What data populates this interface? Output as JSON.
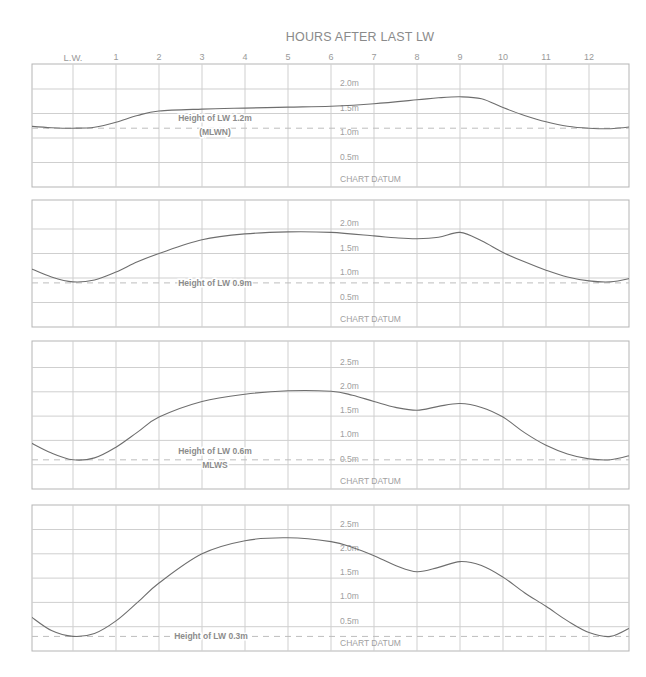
{
  "chart_data": {
    "type": "line",
    "title": "HOURS AFTER LAST LW",
    "xlabel": "HOURS AFTER LAST LW",
    "ylabel": "",
    "grid": true,
    "x_tick_labels": [
      "L.W.",
      "1",
      "2",
      "3",
      "4",
      "5",
      "6",
      "7",
      "8",
      "9",
      "10",
      "11",
      "12"
    ],
    "x_range": [
      -1,
      13
    ],
    "panels": [
      {
        "id": "lw-1-2",
        "lw_label": "Height of LW 1.2m",
        "lw_sublabel": "(MLWN)",
        "lw_height": 1.2,
        "y_tick_labels": [
          "2.0m",
          "1.5m",
          "1.0m",
          "0.5m",
          "CHART DATUM"
        ],
        "ylim": [
          0,
          2.5
        ],
        "x": [
          -1,
          -0.5,
          0,
          0.5,
          1,
          1.5,
          2,
          3,
          4,
          5,
          6,
          7,
          8,
          8.5,
          9,
          9.5,
          10,
          10.5,
          11,
          11.5,
          12,
          12.5,
          13
        ],
        "values": [
          1.24,
          1.21,
          1.2,
          1.22,
          1.32,
          1.46,
          1.55,
          1.59,
          1.61,
          1.63,
          1.65,
          1.7,
          1.78,
          1.82,
          1.84,
          1.8,
          1.62,
          1.46,
          1.33,
          1.24,
          1.2,
          1.19,
          1.23
        ]
      },
      {
        "id": "lw-0-9",
        "lw_label": "Height of LW 0.9m",
        "lw_sublabel": "",
        "lw_height": 0.9,
        "y_tick_labels": [
          "2.0m",
          "1.5m",
          "1.0m",
          "0.5m",
          "CHART DATUM"
        ],
        "ylim": [
          0,
          2.5
        ],
        "x": [
          -1,
          -0.5,
          0,
          0.5,
          1,
          1.5,
          2,
          3,
          4,
          5,
          6,
          7,
          7.5,
          8,
          8.5,
          9,
          9.5,
          10,
          10.5,
          11,
          11.5,
          12,
          12.5,
          13
        ],
        "values": [
          1.2,
          1.02,
          0.92,
          0.96,
          1.12,
          1.33,
          1.5,
          1.78,
          1.9,
          1.94,
          1.93,
          1.86,
          1.82,
          1.8,
          1.83,
          1.93,
          1.76,
          1.52,
          1.33,
          1.16,
          1.02,
          0.94,
          0.92,
          1.0
        ]
      },
      {
        "id": "lw-0-6",
        "lw_label": "Height of LW 0.6m",
        "lw_sublabel": "MLWS",
        "lw_height": 0.6,
        "y_tick_labels": [
          "2.5m",
          "2.0m",
          "1.5m",
          "1.0m",
          "0.5m",
          "CHART DATUM"
        ],
        "ylim": [
          0,
          3.0
        ],
        "x": [
          -1,
          -0.5,
          0,
          0.5,
          1,
          1.5,
          2,
          3,
          4,
          5,
          6,
          6.5,
          7,
          7.5,
          8,
          8.5,
          9,
          9.5,
          10,
          10.5,
          11,
          11.5,
          12,
          12.5,
          13
        ],
        "values": [
          0.96,
          0.74,
          0.6,
          0.64,
          0.86,
          1.17,
          1.48,
          1.8,
          1.95,
          2.02,
          2.01,
          1.93,
          1.8,
          1.68,
          1.62,
          1.7,
          1.76,
          1.68,
          1.48,
          1.16,
          0.9,
          0.72,
          0.62,
          0.6,
          0.7
        ]
      },
      {
        "id": "lw-0-3",
        "lw_label": "Height of LW 0.3m",
        "lw_sublabel": "",
        "lw_height": 0.3,
        "y_tick_labels": [
          "2.5m",
          "2.0m",
          "1.5m",
          "1.0m",
          "0.5m",
          "CHART DATUM"
        ],
        "ylim": [
          0,
          3.0
        ],
        "x": [
          -1,
          -0.5,
          0,
          0.5,
          1,
          1.5,
          2,
          3,
          4,
          5,
          6,
          6.5,
          7,
          7.5,
          8,
          8.5,
          9,
          9.5,
          10,
          10.5,
          11,
          11.5,
          12,
          12.5,
          13
        ],
        "values": [
          0.72,
          0.42,
          0.3,
          0.36,
          0.62,
          1.0,
          1.4,
          2.0,
          2.27,
          2.33,
          2.25,
          2.13,
          1.96,
          1.76,
          1.63,
          1.72,
          1.84,
          1.76,
          1.52,
          1.2,
          0.92,
          0.62,
          0.38,
          0.3,
          0.5
        ]
      }
    ]
  },
  "header": {
    "title": "HOURS AFTER LAST LW"
  }
}
